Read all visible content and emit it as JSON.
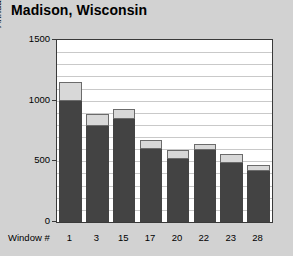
{
  "title": "Madison, Wisconsin",
  "chart_data": {
    "type": "bar",
    "title": "Madison, Wisconsin",
    "subtitle": "",
    "xlabel": "Window #",
    "ylabel": "Annual Heating & Cooling Bill, $",
    "categories": [
      "1",
      "3",
      "15",
      "17",
      "20",
      "22",
      "23",
      "28"
    ],
    "series": [
      {
        "name": "lower-segment",
        "color": "#434343",
        "values": [
          1000,
          790,
          850,
          600,
          520,
          590,
          490,
          420
        ]
      },
      {
        "name": "upper-segment",
        "color": "#d8d8d8",
        "values": [
          150,
          100,
          80,
          80,
          70,
          50,
          70,
          50
        ]
      }
    ],
    "totals": [
      1150,
      890,
      930,
      680,
      590,
      640,
      560,
      470
    ],
    "stacked": true,
    "ylim": [
      0,
      1500
    ],
    "ytick_labels": [
      "0",
      "500",
      "1000",
      "1500"
    ],
    "ytick_values": [
      0,
      500,
      1000,
      1500
    ],
    "gridline_interval": 100,
    "grid": true,
    "legend": "none",
    "bar_count": 8
  },
  "colors": {
    "page_background": "#d2d2d2",
    "panel_background": "#ffffff",
    "axis_line": "#3a3a3a",
    "gridline": "#c9c9c9",
    "bar_lower": "#434343",
    "bar_upper": "#d8d8d8",
    "bar_upper_border": "#6b6b6b",
    "text": "#000000"
  }
}
